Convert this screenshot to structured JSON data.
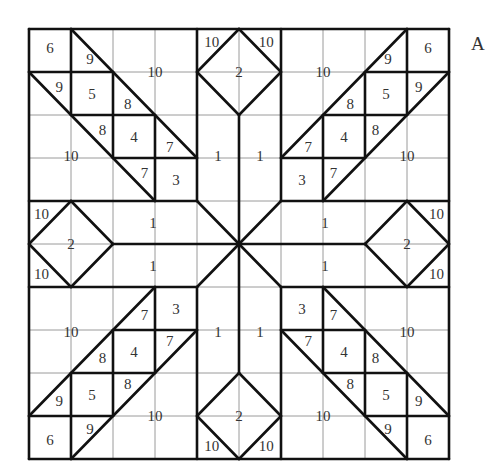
{
  "figure": {
    "label": "A",
    "grid": {
      "cols": 10,
      "rows": 10,
      "x0": 29,
      "y0": 29,
      "cell_w": 42,
      "cell_h": 43
    },
    "colors": {
      "thin_grid": "#9a9a9a",
      "thick_line": "#111111",
      "text": "#333333"
    },
    "quadrant_segments_tl": [
      [
        0,
        0,
        10,
        0
      ],
      [
        0,
        0,
        0,
        10
      ],
      [
        1,
        0,
        1,
        2
      ],
      [
        0,
        1,
        2,
        1
      ],
      [
        2,
        1,
        2,
        3
      ],
      [
        1,
        2,
        3,
        2
      ],
      [
        3,
        2,
        3,
        4
      ],
      [
        2,
        3,
        4,
        3
      ],
      [
        1,
        0,
        4,
        3
      ],
      [
        0,
        1,
        3,
        4
      ],
      [
        4,
        1,
        5,
        0
      ],
      [
        4,
        1,
        5,
        2
      ],
      [
        0,
        5,
        1,
        4
      ],
      [
        1,
        4,
        2,
        5
      ],
      [
        4,
        4,
        5,
        5
      ],
      [
        5,
        2,
        5,
        5
      ],
      [
        2,
        5,
        5,
        5
      ],
      [
        4,
        0,
        4,
        4
      ],
      [
        0,
        4,
        4,
        4
      ]
    ],
    "labels": [
      {
        "t": "6",
        "x": 0.5,
        "y": 0.45
      },
      {
        "t": "9",
        "x": 1.45,
        "y": 0.7
      },
      {
        "t": "9",
        "x": 0.72,
        "y": 1.35
      },
      {
        "t": "5",
        "x": 1.5,
        "y": 1.5
      },
      {
        "t": "8",
        "x": 2.35,
        "y": 1.75
      },
      {
        "t": "8",
        "x": 1.75,
        "y": 2.35
      },
      {
        "t": "4",
        "x": 2.5,
        "y": 2.5
      },
      {
        "t": "7",
        "x": 3.35,
        "y": 2.75
      },
      {
        "t": "7",
        "x": 2.75,
        "y": 3.35
      },
      {
        "t": "3",
        "x": 3.5,
        "y": 3.5
      },
      {
        "t": "10",
        "x": 3.0,
        "y": 1.0
      },
      {
        "t": "10",
        "x": 1.0,
        "y": 2.95
      },
      {
        "t": "1",
        "x": 4.5,
        "y": 2.95
      },
      {
        "t": "1",
        "x": 2.95,
        "y": 4.5
      },
      {
        "t": "10",
        "x": 4.35,
        "y": 0.3
      },
      {
        "t": "2",
        "x": 5.0,
        "y": 1.0
      },
      {
        "t": "10",
        "x": 5.65,
        "y": 0.3
      },
      {
        "t": "1",
        "x": 5.5,
        "y": 2.95
      },
      {
        "t": "6",
        "x": 9.5,
        "y": 0.45
      },
      {
        "t": "9",
        "x": 8.55,
        "y": 0.7
      },
      {
        "t": "9",
        "x": 9.28,
        "y": 1.35
      },
      {
        "t": "5",
        "x": 8.5,
        "y": 1.5
      },
      {
        "t": "8",
        "x": 7.65,
        "y": 1.75
      },
      {
        "t": "8",
        "x": 8.25,
        "y": 2.35
      },
      {
        "t": "4",
        "x": 7.5,
        "y": 2.5
      },
      {
        "t": "7",
        "x": 6.65,
        "y": 2.75
      },
      {
        "t": "7",
        "x": 7.25,
        "y": 3.35
      },
      {
        "t": "3",
        "x": 6.5,
        "y": 3.5
      },
      {
        "t": "10",
        "x": 7.0,
        "y": 1.0
      },
      {
        "t": "10",
        "x": 9.0,
        "y": 2.95
      },
      {
        "t": "1",
        "x": 7.05,
        "y": 4.5
      },
      {
        "t": "10",
        "x": 0.3,
        "y": 4.3
      },
      {
        "t": "2",
        "x": 1.0,
        "y": 5.0
      },
      {
        "t": "10",
        "x": 0.3,
        "y": 5.7
      },
      {
        "t": "1",
        "x": 2.95,
        "y": 5.5
      },
      {
        "t": "10",
        "x": 9.7,
        "y": 4.3
      },
      {
        "t": "2",
        "x": 9.0,
        "y": 5.0
      },
      {
        "t": "10",
        "x": 9.7,
        "y": 5.7
      },
      {
        "t": "1",
        "x": 7.05,
        "y": 5.5
      },
      {
        "t": "6",
        "x": 0.5,
        "y": 9.55
      },
      {
        "t": "9",
        "x": 1.45,
        "y": 9.3
      },
      {
        "t": "9",
        "x": 0.72,
        "y": 8.65
      },
      {
        "t": "5",
        "x": 1.5,
        "y": 8.5
      },
      {
        "t": "8",
        "x": 2.35,
        "y": 8.25
      },
      {
        "t": "8",
        "x": 1.75,
        "y": 7.65
      },
      {
        "t": "4",
        "x": 2.5,
        "y": 7.5
      },
      {
        "t": "7",
        "x": 3.35,
        "y": 7.25
      },
      {
        "t": "7",
        "x": 2.75,
        "y": 6.65
      },
      {
        "t": "3",
        "x": 3.5,
        "y": 6.5
      },
      {
        "t": "10",
        "x": 3.0,
        "y": 9.0
      },
      {
        "t": "10",
        "x": 1.0,
        "y": 7.05
      },
      {
        "t": "1",
        "x": 4.5,
        "y": 7.05
      },
      {
        "t": "1",
        "x": 5.5,
        "y": 7.05
      },
      {
        "t": "10",
        "x": 4.35,
        "y": 9.7
      },
      {
        "t": "2",
        "x": 5.0,
        "y": 9.0
      },
      {
        "t": "10",
        "x": 5.65,
        "y": 9.7
      },
      {
        "t": "6",
        "x": 9.5,
        "y": 9.55
      },
      {
        "t": "9",
        "x": 8.55,
        "y": 9.3
      },
      {
        "t": "9",
        "x": 9.28,
        "y": 8.65
      },
      {
        "t": "5",
        "x": 8.5,
        "y": 8.5
      },
      {
        "t": "8",
        "x": 8.25,
        "y": 7.65
      },
      {
        "t": "8",
        "x": 7.65,
        "y": 8.25
      },
      {
        "t": "4",
        "x": 7.5,
        "y": 7.5
      },
      {
        "t": "7",
        "x": 7.25,
        "y": 6.65
      },
      {
        "t": "7",
        "x": 6.65,
        "y": 7.25
      },
      {
        "t": "3",
        "x": 6.5,
        "y": 6.5
      },
      {
        "t": "10",
        "x": 7.0,
        "y": 9.0
      },
      {
        "t": "10",
        "x": 9.0,
        "y": 7.05
      }
    ]
  }
}
